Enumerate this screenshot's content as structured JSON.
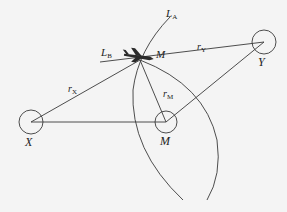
{
  "diagram": {
    "title": "",
    "nodes": [
      {
        "id": "aircraft",
        "label": "M",
        "x": 140,
        "y": 60
      },
      {
        "id": "station-y",
        "label": "Y",
        "x": 264,
        "y": 42,
        "r": 12
      },
      {
        "id": "station-x",
        "label": "X",
        "x": 31,
        "y": 122,
        "r": 12
      },
      {
        "id": "station-m",
        "label": "M",
        "x": 166,
        "y": 122,
        "r": 11
      }
    ],
    "edges": [
      {
        "from": "aircraft",
        "to": "station-x",
        "label": "r",
        "sub": "X"
      },
      {
        "from": "aircraft",
        "to": "station-y",
        "label": "r",
        "sub": "Y"
      },
      {
        "from": "aircraft",
        "to": "station-m",
        "label": "r",
        "sub": "M"
      },
      {
        "from": "station-x",
        "to": "station-m",
        "label": ""
      },
      {
        "from": "station-m",
        "to": "station-y",
        "label": ""
      }
    ],
    "lines": [
      {
        "id": "line-a",
        "label": "L",
        "sub": "A"
      },
      {
        "id": "line-b",
        "label": "L",
        "sub": "B"
      }
    ],
    "labels": {
      "aircraft": "M",
      "station_y": "Y",
      "station_x": "X",
      "station_m": "M",
      "r_x": "r",
      "r_x_sub": "X",
      "r_y": "r",
      "r_y_sub": "Y",
      "r_m": "r",
      "r_m_sub": "M",
      "l_a": "L",
      "l_a_sub": "A",
      "l_b": "L",
      "l_b_sub": "B"
    },
    "colors": {
      "stroke": "#3a3a3a",
      "background": "#f4f4f4"
    }
  }
}
